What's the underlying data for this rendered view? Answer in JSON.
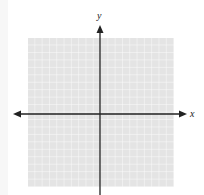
{
  "figure": {
    "type": "coordinate-plane",
    "x_axis_label": "x",
    "y_axis_label": "y",
    "grid": {
      "columns": 20,
      "rows": 20,
      "background_color": "#e6e6e6",
      "line_color": "#ffffff"
    },
    "axis_color": "#222222"
  }
}
